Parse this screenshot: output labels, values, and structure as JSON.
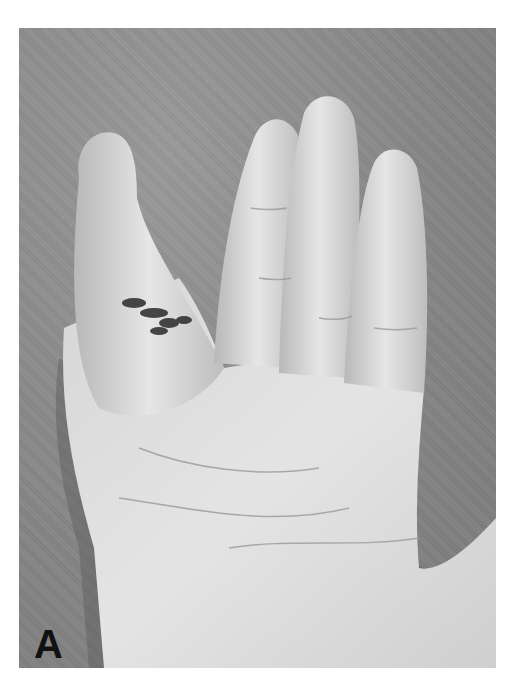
{
  "figure": {
    "panel_label": "A",
    "colors": {
      "background": "#8a8a8a",
      "skin_light": "#e2e2e2",
      "skin_mid": "#c4c4c4",
      "skin_shadow": "#6e6e6e",
      "ink": "#2a2a2a",
      "page": "#ffffff"
    }
  }
}
